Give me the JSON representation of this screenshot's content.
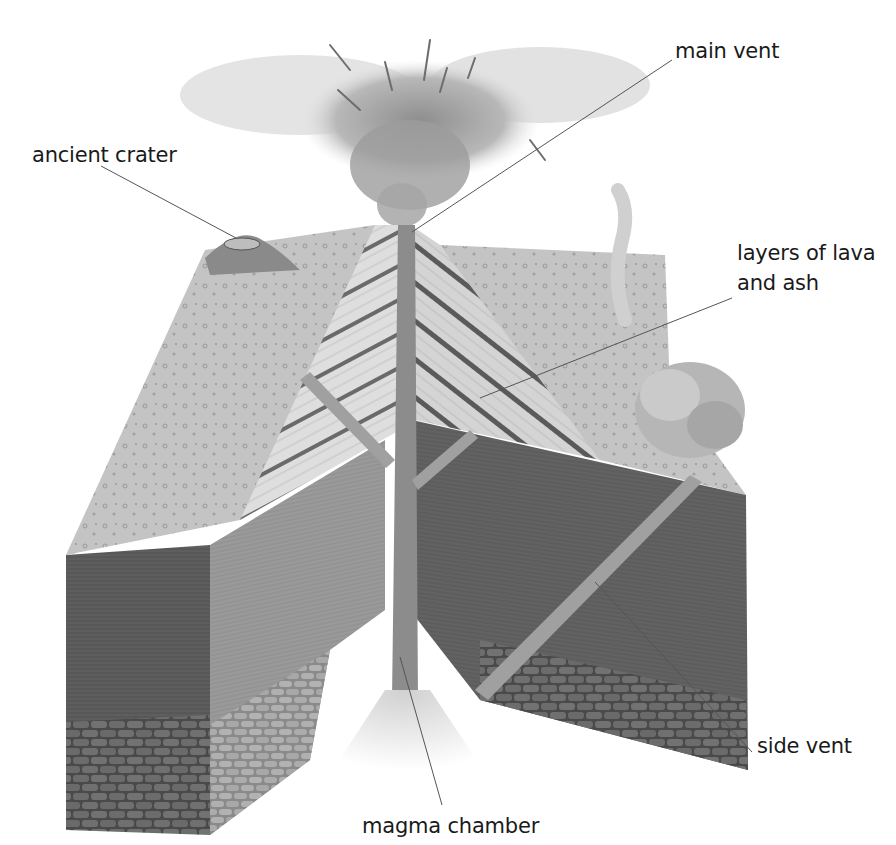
{
  "diagram": {
    "colors": {
      "background": "#ffffff",
      "label_text": "#1a1a1a",
      "leader_line": "#555555",
      "surface_light": "#c8c8c8",
      "rock_dark": "#5a5a5a",
      "rock_mid": "#8a8a8a",
      "lava_layers_light": "#d6d6d6",
      "ash_cloud": "#b5b5b5"
    },
    "labels": {
      "main_vent": "main vent",
      "ancient_crater": "ancient crater",
      "layers_line1": "layers of lava",
      "layers_line2": "and ash",
      "side_vent": "side vent",
      "magma_chamber": "magma chamber"
    },
    "callouts": [
      {
        "id": "main-vent",
        "text": "main vent",
        "label_pos": [
          618,
          22
        ],
        "target": [
          412,
          232
        ]
      },
      {
        "id": "ancient-crater",
        "text": "ancient crater",
        "label_pos": [
          32,
          145
        ],
        "target": [
          236,
          238
        ]
      },
      {
        "id": "layers-of-lava-and-ash",
        "text": "layers of lava and ash",
        "label_pos": [
          737,
          242
        ],
        "target": [
          480,
          398
        ]
      },
      {
        "id": "side-vent",
        "text": "side vent",
        "label_pos": [
          755,
          737
        ],
        "target": [
          595,
          582
        ]
      },
      {
        "id": "magma-chamber",
        "text": "magma chamber",
        "label_pos": [
          362,
          811
        ],
        "target": [
          400,
          657
        ]
      }
    ]
  }
}
